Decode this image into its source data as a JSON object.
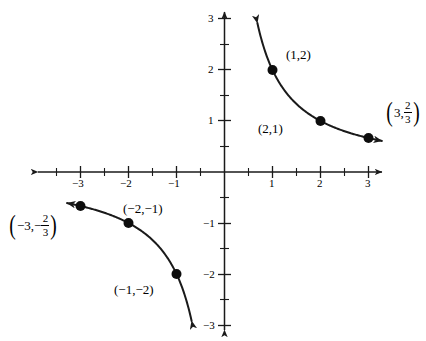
{
  "chart_data": {
    "type": "line",
    "title": "",
    "xlabel": "",
    "ylabel": "",
    "function": "y = 2/x",
    "xlim": [
      -3.45,
      3.45
    ],
    "ylim": [
      -3.2,
      3.2
    ],
    "grid": false,
    "legend": "none",
    "x_ticks": [
      -3,
      -2,
      -1,
      1,
      2,
      3
    ],
    "x_tick_labels": [
      "-3",
      "-2",
      "-1",
      "1",
      "2",
      "3"
    ],
    "y_ticks": [
      -3,
      -2,
      -1,
      1,
      2,
      3
    ],
    "y_tick_labels": [
      "-3",
      "-2",
      "-1",
      "1",
      "2",
      "3"
    ],
    "minor_tick_step": 0.5,
    "axis_color": "#000000",
    "curve_color": "#000000",
    "point_color": "#000000",
    "branches": [
      {
        "name": "upper-right",
        "x": [
          0.68,
          0.8,
          1.0,
          1.25,
          1.5,
          2.0,
          2.5,
          3.0,
          3.4
        ],
        "y": [
          2.94,
          2.5,
          2.0,
          1.6,
          1.333,
          1.0,
          0.8,
          0.667,
          0.588
        ]
      },
      {
        "name": "lower-left",
        "x": [
          -3.4,
          -3.0,
          -2.5,
          -2.0,
          -1.5,
          -1.25,
          -1.0,
          -0.8,
          -0.68
        ],
        "y": [
          -0.588,
          -0.667,
          -0.8,
          -1.0,
          -1.333,
          -1.6,
          -2.0,
          -2.5,
          -2.94
        ]
      }
    ],
    "points": [
      {
        "id": "p1",
        "x": 1,
        "y": 2,
        "label": "(1,2)",
        "label_type": "plain"
      },
      {
        "id": "p2",
        "x": 2,
        "y": 1,
        "label": "(2,1)",
        "label_type": "plain"
      },
      {
        "id": "p3",
        "x": 3,
        "y": 0.667,
        "label_type": "fraction",
        "label_parts": {
          "first": "3,",
          "sign": "",
          "num": "2",
          "den": "3"
        }
      },
      {
        "id": "p4",
        "x": -1,
        "y": -2,
        "label": "(−1,−2)",
        "label_type": "plain"
      },
      {
        "id": "p5",
        "x": -2,
        "y": -1,
        "label": "(−2,−1)",
        "label_type": "plain"
      },
      {
        "id": "p6",
        "x": -3,
        "y": -0.667,
        "label_type": "fraction",
        "label_parts": {
          "first": "−3,",
          "sign": "−",
          "num": "2",
          "den": "3"
        }
      }
    ]
  },
  "axis_labels": {
    "x_neg_3": "−3",
    "x_neg_2": "−2",
    "x_neg_1": "−1",
    "x_pos_1": "1",
    "x_pos_2": "2",
    "x_pos_3": "3",
    "y_pos_3": "3",
    "y_pos_2": "2",
    "y_pos_1": "1",
    "y_neg_1": "−1",
    "y_neg_2": "−2",
    "y_neg_3": "−3"
  },
  "point_labels": {
    "p1": "(1,2)",
    "p2": "(2,1)",
    "p4": "(−1,−2)",
    "p5": "(−2,−1)",
    "p3_first": "3,",
    "p3_num": "2",
    "p3_den": "3",
    "p6_first": "−3,",
    "p6_sign": "−",
    "p6_num": "2",
    "p6_den": "3",
    "paren_open": "(",
    "paren_close": ")"
  }
}
